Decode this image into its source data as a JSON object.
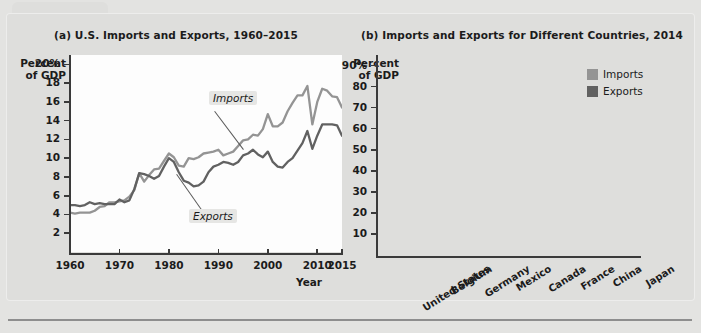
{
  "figure": {
    "background_color": "#dededc",
    "plot_background_color": "#fdfdfd"
  },
  "colors": {
    "imports": "#949494",
    "exports": "#616161",
    "axis": "#3a3a3a",
    "text": "#1b1b1b"
  },
  "panel_a": {
    "title": "(a) U.S. Imports and Exports, 1960–2015",
    "y_axis_title": "Percent\nof GDP",
    "x_axis_title": "Year",
    "y_ticks": [
      "20%",
      "18",
      "16",
      "14",
      "12",
      "10",
      "8",
      "6",
      "4",
      "2"
    ],
    "x_ticks": [
      "1960",
      "1970",
      "1980",
      "1990",
      "2000",
      "2010",
      "2015"
    ],
    "series_labels": {
      "imports": "Imports",
      "exports": "Exports"
    }
  },
  "panel_b": {
    "title": "(b) Imports and Exports for Different Countries, 2014",
    "y_axis_title": "Percent\nof GDP",
    "y_ticks": [
      "90%",
      "80",
      "70",
      "60",
      "50",
      "40",
      "30",
      "20",
      "10"
    ],
    "legend": [
      {
        "label": "Imports",
        "swatch": "imports-swatch"
      },
      {
        "label": "Exports",
        "swatch": "exports-swatch"
      }
    ]
  },
  "chart_data": [
    {
      "type": "line",
      "id": "panel-a",
      "title": "(a) U.S. Imports and Exports, 1960–2015",
      "xlabel": "Year",
      "ylabel": "Percent of GDP",
      "xlim": [
        1960,
        2015
      ],
      "ylim": [
        0,
        21
      ],
      "ytick_values": [
        2,
        4,
        6,
        8,
        10,
        12,
        14,
        16,
        18,
        20
      ],
      "xtick_values": [
        1960,
        1970,
        1980,
        1990,
        2000,
        2010,
        2015
      ],
      "grid": false,
      "legend_position": "inline-annotation",
      "series": [
        {
          "name": "Imports",
          "color": "#949494",
          "x": [
            1960,
            1961,
            1962,
            1963,
            1964,
            1965,
            1966,
            1967,
            1968,
            1969,
            1970,
            1971,
            1972,
            1973,
            1974,
            1975,
            1976,
            1977,
            1978,
            1979,
            1980,
            1981,
            1982,
            1983,
            1984,
            1985,
            1986,
            1987,
            1988,
            1989,
            1990,
            1991,
            1992,
            1993,
            1994,
            1995,
            1996,
            1997,
            1998,
            1999,
            2000,
            2001,
            2002,
            2003,
            2004,
            2005,
            2006,
            2007,
            2008,
            2009,
            2010,
            2011,
            2012,
            2013,
            2014,
            2015
          ],
          "values": [
            4.2,
            4.1,
            4.2,
            4.2,
            4.2,
            4.4,
            4.8,
            4.9,
            5.3,
            5.3,
            5.4,
            5.5,
            5.9,
            6.6,
            8.4,
            7.5,
            8.2,
            8.8,
            8.9,
            9.7,
            10.5,
            10.1,
            9.2,
            9.1,
            10.0,
            9.9,
            10.1,
            10.5,
            10.6,
            10.7,
            10.9,
            10.3,
            10.5,
            10.7,
            11.3,
            11.9,
            12.0,
            12.5,
            12.4,
            13.1,
            14.7,
            13.4,
            13.4,
            13.8,
            15.0,
            15.9,
            16.7,
            16.7,
            17.7,
            13.6,
            16.0,
            17.4,
            17.2,
            16.6,
            16.5,
            15.4
          ]
        },
        {
          "name": "Exports",
          "color": "#616161",
          "x": [
            1960,
            1961,
            1962,
            1963,
            1964,
            1965,
            1966,
            1967,
            1968,
            1969,
            1970,
            1971,
            1972,
            1973,
            1974,
            1975,
            1976,
            1977,
            1978,
            1979,
            1980,
            1981,
            1982,
            1983,
            1984,
            1985,
            1986,
            1987,
            1988,
            1989,
            1990,
            1991,
            1992,
            1993,
            1994,
            1995,
            1996,
            1997,
            1998,
            1999,
            2000,
            2001,
            2002,
            2003,
            2004,
            2005,
            2006,
            2007,
            2008,
            2009,
            2010,
            2011,
            2012,
            2013,
            2014,
            2015
          ],
          "values": [
            5.0,
            5.0,
            4.9,
            5.0,
            5.3,
            5.1,
            5.2,
            5.1,
            5.1,
            5.1,
            5.6,
            5.3,
            5.5,
            6.7,
            8.4,
            8.3,
            8.1,
            7.8,
            8.1,
            9.1,
            10.0,
            9.6,
            8.5,
            7.6,
            7.4,
            7.0,
            7.1,
            7.5,
            8.5,
            9.1,
            9.3,
            9.6,
            9.5,
            9.3,
            9.6,
            10.3,
            10.5,
            10.9,
            10.4,
            10.1,
            10.7,
            9.6,
            9.1,
            9.0,
            9.6,
            10.0,
            10.8,
            11.6,
            12.9,
            11.0,
            12.4,
            13.6,
            13.6,
            13.6,
            13.5,
            12.4
          ]
        }
      ],
      "annotations": [
        {
          "text": "Imports",
          "x": 1993,
          "y": 17.6
        },
        {
          "text": "Exports",
          "x": 1992,
          "y": 4.4
        }
      ]
    },
    {
      "type": "bar",
      "id": "panel-b",
      "title": "(b) Imports and Exports for Different Countries, 2014",
      "xlabel": "",
      "ylabel": "Percent of GDP",
      "ylim": [
        0,
        95
      ],
      "ytick_values": [
        10,
        20,
        30,
        40,
        50,
        60,
        70,
        80,
        90
      ],
      "grid": false,
      "legend_position": "top-right",
      "categories": [
        "United States",
        "Belgium",
        "Germany",
        "Mexico",
        "Canada",
        "France",
        "China",
        "Japan"
      ],
      "series": [
        {
          "name": "Imports",
          "color": "#949494",
          "values": [
            16.5,
            83.0,
            39.3,
            33.6,
            32.5,
            30.6,
            18.9,
            19.0
          ]
        },
        {
          "name": "Exports",
          "color": "#616161",
          "values": [
            13.4,
            84.0,
            45.7,
            32.3,
            31.6,
            28.7,
            22.6,
            16.2
          ]
        }
      ]
    }
  ]
}
